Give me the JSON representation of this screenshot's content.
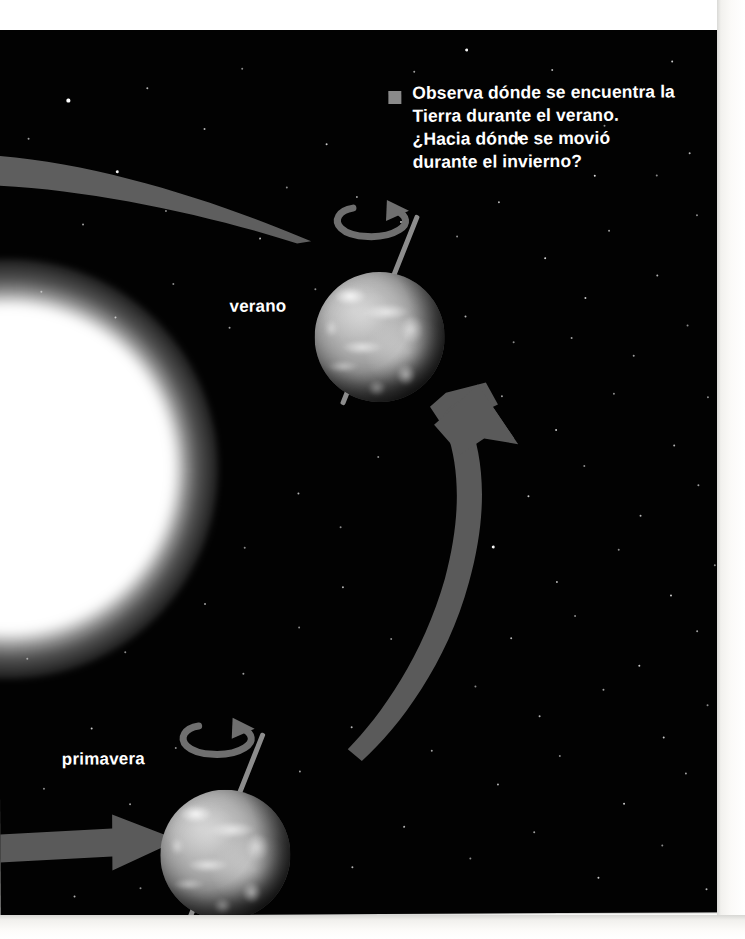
{
  "page": {
    "kind": "textbook-illustration-page",
    "language": "es",
    "background_color": "#020202",
    "paper_color": "#ffffff"
  },
  "callout": {
    "bullet_icon": "filled-square-bullet",
    "bullet_color": "#8a8a8a",
    "text_color": "#ffffff",
    "lines": [
      "Observa dónde se encuentra la",
      "Tierra durante el verano.",
      "¿Hacia dónde se movió",
      "durante el invierno?"
    ],
    "full_text": "Observa dónde se encuentra la Tierra durante el verano. ¿Hacia dónde se movió durante el invierno?"
  },
  "labels": [
    {
      "id": "verano",
      "text": "verano",
      "x": 232,
      "y": 310,
      "color": "#ffffff"
    },
    {
      "id": "primavera",
      "text": "primavera",
      "x": 62,
      "y": 762,
      "color": "#ffffff"
    }
  ],
  "sun": {
    "name": "sun",
    "color": "#ffffff",
    "center_x": 20,
    "center_y": 510,
    "radius": 190
  },
  "earths": [
    {
      "id": "earth-verano",
      "season_label": "verano",
      "center_x": 379,
      "center_y": 310,
      "radius": 65,
      "axis_tilt_deg": 23,
      "spin_arrow": "rotation-arrow-counterclockwise"
    },
    {
      "id": "earth-primavera",
      "season_label": "primavera",
      "center_x": 222,
      "center_y": 827,
      "radius": 65,
      "axis_tilt_deg": 23,
      "spin_arrow": "rotation-arrow-counterclockwise"
    }
  ],
  "arrows": [
    {
      "id": "orbit-arrow-upper-left",
      "name": "orbit-path-arrow-top",
      "description": "tapering curved band entering from the left edge and narrowing toward the summer Earth",
      "color": "#5e5e5e"
    },
    {
      "id": "orbit-arrow-right",
      "name": "orbit-direction-arrow-right",
      "description": "large curved arrow sweeping from lower left upward and pointing up toward the summer Earth",
      "color": "#5a5a5a",
      "points_to": "verano"
    },
    {
      "id": "orbit-arrow-bottom-left",
      "name": "orbit-direction-arrow-bottom",
      "description": "straight horizontal arrow from the left edge pointing right toward the spring Earth",
      "color": "#5a5a5a",
      "points_to": "primavera"
    }
  ],
  "colors": {
    "space": "#020202",
    "star": "#ffffff",
    "arrow_gray": "#5a5a5a",
    "label_white": "#ffffff",
    "bullet_gray": "#8a8a8a",
    "axis_gray": "#8d8d8d"
  },
  "stars": [
    [
      72,
      72,
      1.7
    ],
    [
      151,
      60,
      1.2
    ],
    [
      246,
      41,
      1.0
    ],
    [
      330,
      117,
      1.3
    ],
    [
      418,
      45,
      1.1
    ],
    [
      470,
      23,
      1.5
    ],
    [
      523,
      112,
      1.6
    ],
    [
      556,
      44,
      1.2
    ],
    [
      598,
      150,
      1.4
    ],
    [
      640,
      70,
      1.1
    ],
    [
      676,
      36,
      1.3
    ],
    [
      693,
      128,
      1.2
    ],
    [
      208,
      101,
      1.2
    ],
    [
      120,
      143,
      1.5
    ],
    [
      86,
      196,
      1.1
    ],
    [
      169,
      183,
      1.0
    ],
    [
      263,
      211,
      1.2
    ],
    [
      290,
      160,
      1.0
    ],
    [
      360,
      170,
      1.1
    ],
    [
      404,
      195,
      1.3
    ],
    [
      460,
      210,
      1.0
    ],
    [
      502,
      176,
      1.2
    ],
    [
      548,
      232,
      1.4
    ],
    [
      612,
      205,
      1.1
    ],
    [
      660,
      250,
      1.2
    ],
    [
      700,
      190,
      1.0
    ],
    [
      44,
      263,
      1.1
    ],
    [
      118,
      289,
      1.3
    ],
    [
      176,
      256,
      1.0
    ],
    [
      232,
      300,
      1.1
    ],
    [
      318,
      262,
      1.0
    ],
    [
      380,
      430,
      1.0
    ],
    [
      468,
      290,
      1.2
    ],
    [
      516,
      316,
      1.0
    ],
    [
      588,
      272,
      1.3
    ],
    [
      636,
      330,
      1.1
    ],
    [
      690,
      300,
      1.0
    ],
    [
      504,
      370,
      1.1
    ],
    [
      558,
      404,
      1.3
    ],
    [
      616,
      368,
      1.0
    ],
    [
      676,
      420,
      1.2
    ],
    [
      710,
      372,
      1.0
    ],
    [
      466,
      436,
      1.1
    ],
    [
      530,
      470,
      1.3
    ],
    [
      586,
      440,
      1.0
    ],
    [
      642,
      490,
      1.2
    ],
    [
      700,
      460,
      1.1
    ],
    [
      494,
      520,
      1.5
    ],
    [
      558,
      556,
      1.2
    ],
    [
      620,
      524,
      1.0
    ],
    [
      672,
      570,
      1.3
    ],
    [
      716,
      540,
      1.0
    ],
    [
      452,
      580,
      1.1
    ],
    [
      512,
      612,
      1.2
    ],
    [
      576,
      590,
      1.0
    ],
    [
      640,
      640,
      1.3
    ],
    [
      698,
      606,
      1.1
    ],
    [
      476,
      660,
      1.0
    ],
    [
      540,
      690,
      1.2
    ],
    [
      604,
      664,
      1.1
    ],
    [
      664,
      712,
      1.3
    ],
    [
      708,
      680,
      1.0
    ],
    [
      432,
      724,
      1.1
    ],
    [
      498,
      758,
      1.2
    ],
    [
      560,
      730,
      1.0
    ],
    [
      624,
      778,
      1.3
    ],
    [
      686,
      748,
      1.1
    ],
    [
      404,
      800,
      1.2
    ],
    [
      470,
      832,
      1.0
    ],
    [
      534,
      806,
      1.1
    ],
    [
      598,
      852,
      1.3
    ],
    [
      662,
      820,
      1.0
    ],
    [
      706,
      864,
      1.2
    ],
    [
      36,
      352,
      1.0
    ],
    [
      62,
      420,
      1.2
    ],
    [
      28,
      630,
      1.1
    ],
    [
      92,
      700,
      1.3
    ],
    [
      44,
      760,
      1.0
    ],
    [
      130,
      776,
      1.1
    ],
    [
      28,
      812,
      1.4
    ],
    [
      74,
      868,
      1.2
    ],
    [
      140,
      860,
      1.0
    ],
    [
      196,
      890,
      1.1
    ],
    [
      268,
      862,
      1.3
    ],
    [
      312,
      896,
      1.0
    ],
    [
      352,
      840,
      1.2
    ],
    [
      248,
      800,
      1.0
    ],
    [
      300,
      744,
      1.1
    ],
    [
      352,
      700,
      1.2
    ],
    [
      176,
      720,
      1.0
    ],
    [
      244,
      646,
      1.1
    ],
    [
      300,
      600,
      1.0
    ],
    [
      344,
      560,
      1.2
    ],
    [
      392,
      612,
      1.0
    ],
    [
      420,
      660,
      1.1
    ],
    [
      246,
      520,
      1.0
    ],
    [
      300,
      466,
      1.2
    ],
    [
      342,
      500,
      1.0
    ],
    [
      398,
      340,
      1.1
    ],
    [
      452,
      136,
      1.2
    ],
    [
      608,
      100,
      1.0
    ],
    [
      32,
      110,
      1.1
    ],
    [
      500,
      60,
      1.0
    ],
    [
      574,
      312,
      1.1
    ],
    [
      660,
      150,
      1.0
    ],
    [
      126,
      624,
      1.0
    ],
    [
      206,
      576,
      1.1
    ]
  ]
}
